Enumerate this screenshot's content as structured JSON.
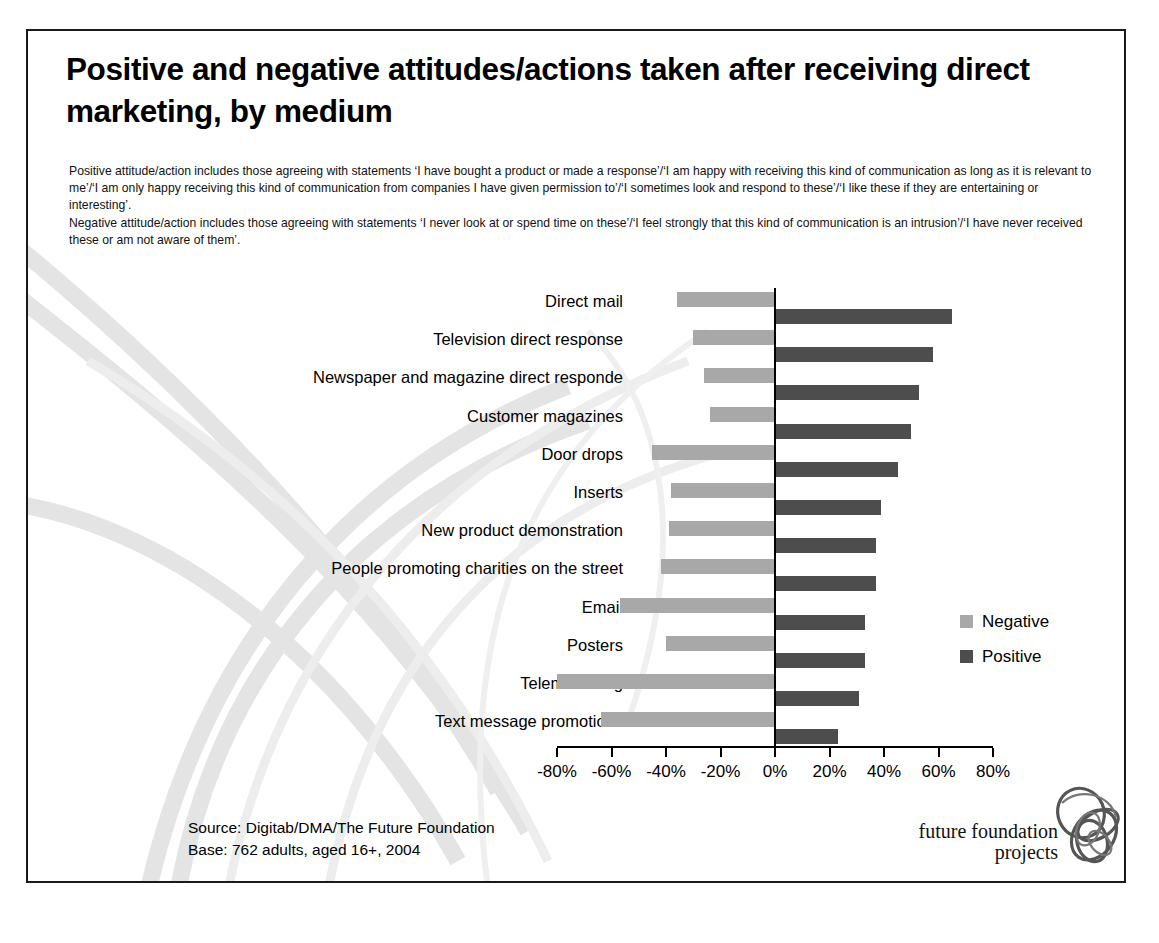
{
  "slide": {
    "title": "Positive and negative attitudes/actions taken after receiving direct marketing, by medium",
    "notes": [
      "Positive attitude/action includes those agreeing with statements ‘I have bought a product or made a response’/‘I am happy with receiving this kind of communication as long as it is relevant to me’/‘I am only happy receiving this kind of communication from companies I have given permission to’/‘I sometimes look and respond to these’/‘I like these if they are entertaining or interesting’.",
      "Negative attitude/action includes those agreeing with statements ‘I never look at or spend time on these’/‘I feel strongly that this kind of communication is an intrusion’/‘I have never received these or am not aware of them’."
    ],
    "source_line": "Source: Digitab/DMA/The Future Foundation",
    "base_line": "Base: 762 adults, aged 16+,  2004"
  },
  "logo": {
    "line1": "future foundation",
    "line2": "projects"
  },
  "chart_data": {
    "type": "bar",
    "orientation": "horizontal",
    "layout": "diverging",
    "title": "Positive and negative attitudes/actions taken after receiving direct marketing, by medium",
    "xlabel": "",
    "ylabel": "",
    "xlim": [
      -80,
      80
    ],
    "xticks": [
      -80,
      -60,
      -40,
      -20,
      0,
      20,
      40,
      60,
      80
    ],
    "xtick_labels": [
      "-80%",
      "-60%",
      "-40%",
      "-20%",
      "0%",
      "20%",
      "40%",
      "60%",
      "80%"
    ],
    "grid": false,
    "legend_position": "right",
    "categories": [
      "Direct mail",
      "Television direct response",
      "Newspaper and magazine direct responde",
      "Customer magazines",
      "Door drops",
      "Inserts",
      "New product demonstration",
      "People promoting charities on the street",
      "Email",
      "Posters",
      "Telemarketing",
      "Text message promotions"
    ],
    "series": [
      {
        "name": "Negative",
        "color": "#a8a8a8",
        "values": [
          -36,
          -30,
          -26,
          -24,
          -45,
          -38,
          -39,
          -42,
          -57,
          -40,
          -80,
          -64
        ]
      },
      {
        "name": "Positive",
        "color": "#4d4d4d",
        "values": [
          65,
          58,
          53,
          50,
          45,
          39,
          37,
          37,
          33,
          33,
          31,
          23
        ]
      }
    ]
  }
}
